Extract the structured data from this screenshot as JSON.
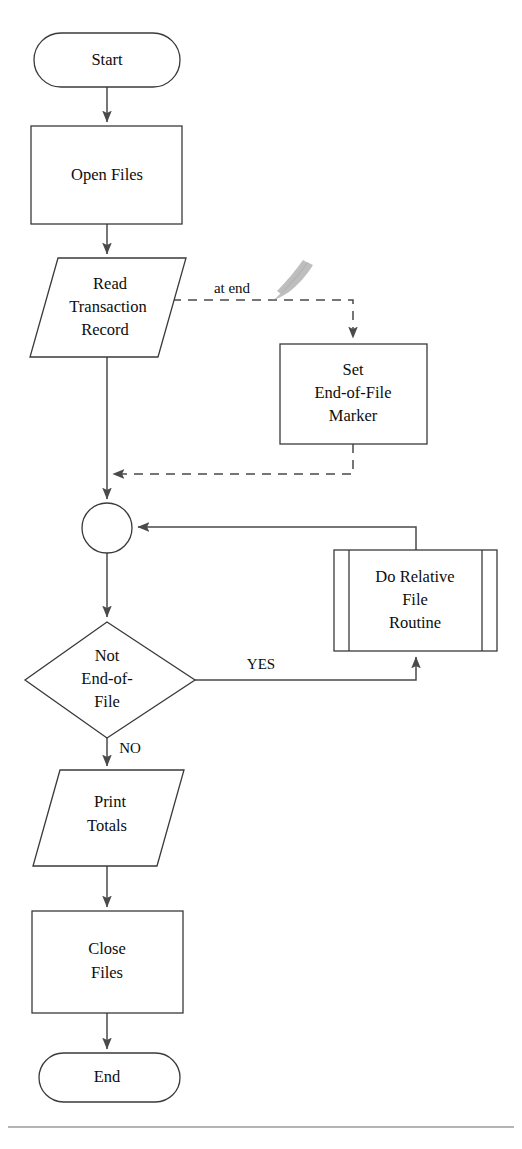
{
  "diagram": {
    "nodes": [
      {
        "id": "start",
        "shape": "terminator",
        "lines": [
          "Start"
        ]
      },
      {
        "id": "open",
        "shape": "process",
        "lines": [
          "Open Files"
        ]
      },
      {
        "id": "read",
        "shape": "input-output",
        "lines": [
          "Read",
          "Transaction",
          "Record"
        ]
      },
      {
        "id": "seteof",
        "shape": "process",
        "lines": [
          "Set",
          "End-of-File",
          "Marker"
        ]
      },
      {
        "id": "connector",
        "shape": "connector-circle",
        "lines": []
      },
      {
        "id": "decision",
        "shape": "decision",
        "lines": [
          "Not",
          "End-of-",
          "File"
        ]
      },
      {
        "id": "routine",
        "shape": "predefined-process",
        "lines": [
          "Do Relative",
          "File",
          "Routine"
        ]
      },
      {
        "id": "print",
        "shape": "input-output",
        "lines": [
          "Print",
          "Totals"
        ]
      },
      {
        "id": "close",
        "shape": "process",
        "lines": [
          "Close Files"
        ]
      },
      {
        "id": "end",
        "shape": "terminator",
        "lines": [
          "End"
        ]
      }
    ],
    "edge_labels": {
      "at_end": "at end",
      "yes": "YES",
      "no": "NO"
    },
    "colors": {
      "stroke": "#3a3a3a",
      "line": "#4a4a4a",
      "text": "#0d0d0d",
      "background": "#ffffff",
      "smudge": "#b3b3b3"
    }
  },
  "node_text": {
    "start": "Start",
    "open_files": "Open Files",
    "read_l1": "Read",
    "read_l2": "Transaction",
    "read_l3": "Record",
    "seteof_l1": "Set",
    "seteof_l2": "End-of-File",
    "seteof_l3": "Marker",
    "decision_l1": "Not",
    "decision_l2": "End-of-",
    "decision_l3": "File",
    "routine_l1": "Do Relative",
    "routine_l2": "File",
    "routine_l3": "Routine",
    "print_l1": "Print",
    "print_l2": "Totals",
    "close_l1": "Close",
    "close_l2": "Files",
    "end": "End"
  },
  "edges": {
    "at_end": "at end",
    "yes": "YES",
    "no": "NO"
  },
  "footer": {
    "caption": ""
  }
}
